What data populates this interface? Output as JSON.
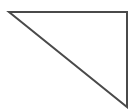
{
  "diagram": {
    "shape": "right-triangle",
    "stroke_color": "#4a4a4a",
    "fill_color": "#ffffff",
    "stroke_width": 2,
    "vertices": {
      "top_left": [
        9,
        12
      ],
      "top_right": [
        127,
        12
      ],
      "bottom_right": [
        127,
        107
      ]
    }
  }
}
